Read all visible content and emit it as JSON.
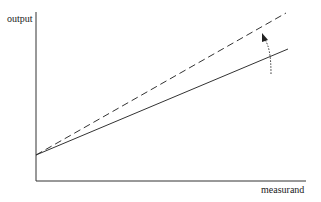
{
  "diagram": {
    "type": "line",
    "title": "",
    "xlabel": "measurand",
    "ylabel": "output",
    "colors": {
      "axis": "#333333",
      "line": "#333333"
    },
    "series": [
      {
        "name": "original response",
        "style": "solid",
        "start": [
          0,
          0.15
        ],
        "end": [
          0.93,
          0.78
        ]
      },
      {
        "name": "increased sensitivity response",
        "style": "dashed",
        "start": [
          0,
          0.15
        ],
        "end": [
          0.92,
          0.99
        ]
      }
    ],
    "annotation": {
      "type": "curved-arrow",
      "style": "dotted",
      "meaning": "sensitivity increase (slope change)"
    }
  }
}
